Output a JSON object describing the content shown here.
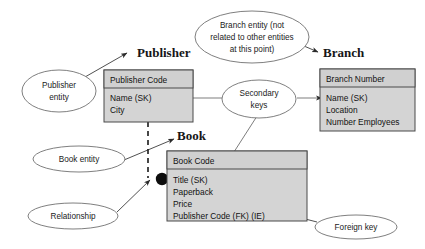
{
  "diagram": {
    "background_color": "#ffffff",
    "entity_fill_color": "#d4d4d4",
    "entity_border_color": "#4a4a4a",
    "callout_border_color": "#707070",
    "connector_color": "#3c3c3c"
  },
  "entities": [
    {
      "id": "publisher",
      "name": "Publisher",
      "primary_key": "Publisher Code",
      "attributes": [
        "Name (SK)",
        "City"
      ]
    },
    {
      "id": "branch",
      "name": "Branch",
      "primary_key": "Branch Number",
      "attributes": [
        "Name (SK)",
        "Location",
        "Number Employees"
      ]
    },
    {
      "id": "book",
      "name": "Book",
      "primary_key": "Book Code",
      "attributes": [
        "Title (SK)",
        "Paperback",
        "Price",
        "Publisher Code (FK) (IE)"
      ]
    }
  ],
  "callouts": [
    {
      "id": "publisher-entity",
      "lines": [
        "Publisher",
        "entity"
      ]
    },
    {
      "id": "branch-entity",
      "lines": [
        "Branch entity (not",
        "related to other entities",
        "at this point)"
      ]
    },
    {
      "id": "secondary-keys",
      "lines": [
        "Secondary",
        "keys"
      ]
    },
    {
      "id": "book-entity",
      "lines": [
        "Book entity"
      ]
    },
    {
      "id": "relationship",
      "lines": [
        "Relationship"
      ]
    },
    {
      "id": "foreign-key",
      "lines": [
        "Foreign key"
      ]
    }
  ]
}
